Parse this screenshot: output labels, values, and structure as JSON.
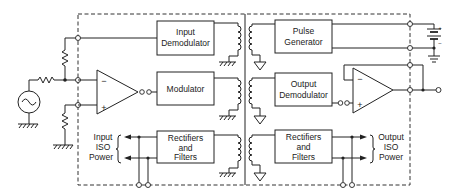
{
  "diagram": {
    "blocks": {
      "input_demodulator": [
        "Input",
        "Demodulator"
      ],
      "modulator": [
        "Modulator"
      ],
      "rectifiers_left": [
        "Rectifiers",
        "and",
        "Filters"
      ],
      "pulse_generator": [
        "Pulse",
        "Generator"
      ],
      "output_demodulator": [
        "Output",
        "Demodulator"
      ],
      "rectifiers_right": [
        "Rectifiers",
        "and",
        "Filters"
      ]
    },
    "labels": {
      "input_iso_power": [
        "Input",
        "ISO",
        "Power"
      ],
      "output_iso_power": [
        "Output",
        "ISO",
        "Power"
      ]
    },
    "opamp_left": {
      "minus": "−",
      "plus": "+"
    },
    "opamp_right": {
      "minus": "−",
      "plus": "+"
    },
    "battery": {
      "plus": "+",
      "minus": "−"
    }
  }
}
